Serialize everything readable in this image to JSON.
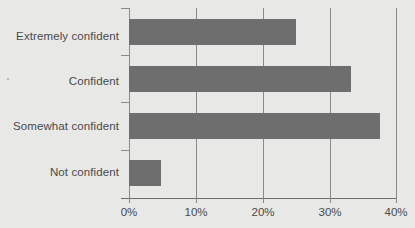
{
  "chart_data": {
    "type": "bar",
    "orientation": "horizontal",
    "title": "",
    "subtitle": "",
    "xlabel": "",
    "ylabel": "",
    "categories": [
      "Extremely confident",
      "Confident",
      "Somewhat confident",
      "Not confident"
    ],
    "values": [
      25.0,
      33.3,
      37.6,
      4.8
    ],
    "value_unit": "%",
    "xlim": [
      0,
      40
    ],
    "xticks": [
      0,
      10,
      20,
      30,
      40
    ],
    "xtick_labels": [
      "0%",
      "10%",
      "20%",
      "30%",
      "40%"
    ],
    "grid": true,
    "grid_axis": "x",
    "legend": false,
    "legend_position": "none",
    "series": [
      {
        "name": "Confidence level",
        "color": "#6e6e6e",
        "values": [
          25.0,
          33.3,
          37.6,
          4.8
        ]
      }
    ]
  },
  "colors": {
    "background": "#e8e8e6",
    "bar": "#6e6e6e",
    "gridline": "#8a8a88",
    "axis": "#6f6f6f",
    "text": "#4a4a4a"
  }
}
